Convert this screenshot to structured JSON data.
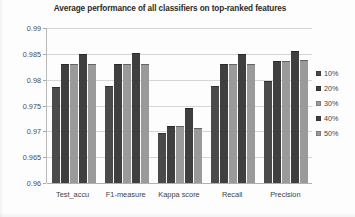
{
  "chart_data": {
    "type": "bar",
    "title": "Average performance of all classifiers on top-ranked features",
    "xlabel": "",
    "ylabel": "",
    "ylim": [
      0.96,
      0.99
    ],
    "ytick_labels": [
      "0.99",
      "0.985",
      "0.98",
      "0.975",
      "0.97",
      "0.965",
      "0.96"
    ],
    "ytick_values": [
      0.99,
      0.985,
      0.98,
      0.975,
      0.97,
      0.965,
      0.96
    ],
    "grid": true,
    "legend_position": "right",
    "categories": [
      "Test_accu",
      "F1-measure",
      "Kappa score",
      "Recall",
      "Precision"
    ],
    "series": [
      {
        "name": "10%",
        "color": "#4a4a4a",
        "values": [
          0.9786,
          0.9788,
          0.9697,
          0.9787,
          0.9798
        ]
      },
      {
        "name": "20%",
        "color": "#3f3f3f",
        "values": [
          0.983,
          0.983,
          0.971,
          0.983,
          0.9837
        ]
      },
      {
        "name": "30%",
        "color": "#9a9a9a",
        "values": [
          0.983,
          0.983,
          0.971,
          0.983,
          0.9837
        ]
      },
      {
        "name": "40%",
        "color": "#3f3f3f",
        "values": [
          0.985,
          0.9852,
          0.9745,
          0.985,
          0.9855
        ]
      },
      {
        "name": "50%",
        "color": "#9a9a9a",
        "values": [
          0.983,
          0.983,
          0.9707,
          0.983,
          0.9838
        ]
      }
    ]
  },
  "legend": {
    "items": [
      {
        "label": "10%"
      },
      {
        "label": "20%"
      },
      {
        "label": "30%"
      },
      {
        "label": "40%"
      },
      {
        "label": "50%"
      }
    ]
  }
}
